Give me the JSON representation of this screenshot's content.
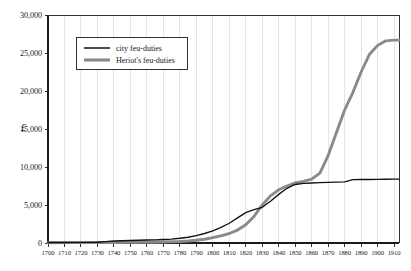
{
  "chart_data": {
    "type": "line",
    "title": "",
    "subtitle": "",
    "xlabel": "",
    "ylabel": "£",
    "xlim": [
      1700,
      1913
    ],
    "ylim": [
      0,
      30000
    ],
    "grid": true,
    "legend_position": "top-left",
    "x_tick_labels": [
      "1700",
      "1710",
      "1720",
      "1730",
      "1740",
      "1750",
      "1760",
      "1770",
      "1780",
      "1790",
      "1800",
      "1810",
      "1820",
      "1830",
      "1840",
      "1850",
      "1860",
      "1870",
      "1880",
      "1890",
      "1900",
      "1910"
    ],
    "x_ticks": [
      1700,
      1710,
      1720,
      1730,
      1740,
      1750,
      1760,
      1770,
      1780,
      1790,
      1800,
      1810,
      1820,
      1830,
      1840,
      1850,
      1860,
      1870,
      1880,
      1890,
      1900,
      1910
    ],
    "y_tick_labels": [
      "0",
      "5,000",
      "10,000",
      "15,000",
      "20,000",
      "25,000",
      "30,000"
    ],
    "y_ticks": [
      0,
      5000,
      10000,
      15000,
      20000,
      25000,
      30000
    ],
    "legend": [
      "city feu-duties",
      "Heriot's feu-duties"
    ],
    "series": [
      {
        "name": "city feu-duties",
        "color": "#111111",
        "x": [
          1700,
          1710,
          1720,
          1730,
          1735,
          1740,
          1745,
          1750,
          1755,
          1760,
          1765,
          1770,
          1775,
          1780,
          1785,
          1790,
          1795,
          1800,
          1805,
          1810,
          1815,
          1820,
          1825,
          1830,
          1835,
          1840,
          1845,
          1850,
          1855,
          1860,
          1865,
          1870,
          1875,
          1880,
          1885,
          1890,
          1895,
          1900,
          1905,
          1910,
          1913
        ],
        "values": [
          60,
          70,
          80,
          95,
          180,
          260,
          300,
          330,
          360,
          390,
          420,
          460,
          520,
          620,
          760,
          960,
          1250,
          1600,
          2050,
          2600,
          3300,
          4000,
          4400,
          4700,
          5500,
          6400,
          7200,
          7700,
          7850,
          7900,
          7950,
          7970,
          8000,
          8050,
          8330,
          8350,
          8360,
          8380,
          8390,
          8400,
          8400
        ]
      },
      {
        "name": "Heriot's feu-duties",
        "color": "#8a8a8a",
        "x": [
          1700,
          1710,
          1720,
          1730,
          1740,
          1750,
          1760,
          1770,
          1780,
          1785,
          1790,
          1795,
          1800,
          1805,
          1810,
          1815,
          1820,
          1825,
          1830,
          1835,
          1840,
          1845,
          1850,
          1855,
          1860,
          1865,
          1870,
          1875,
          1880,
          1885,
          1890,
          1895,
          1900,
          1905,
          1910,
          1913
        ],
        "values": [
          40,
          45,
          50,
          60,
          70,
          85,
          100,
          130,
          190,
          260,
          360,
          500,
          700,
          950,
          1250,
          1700,
          2400,
          3500,
          5000,
          6200,
          7000,
          7500,
          7900,
          8100,
          8400,
          9200,
          11500,
          14500,
          17500,
          19800,
          22500,
          24800,
          26000,
          26600,
          26700,
          26700
        ]
      }
    ]
  },
  "legend": {
    "items": [
      {
        "label": "city feu-duties",
        "style": "thin-black-line"
      },
      {
        "label": "Heriot's feu-duties",
        "style": "thick-gray-line"
      }
    ]
  },
  "axes": {
    "y_unit_symbol": "£"
  }
}
